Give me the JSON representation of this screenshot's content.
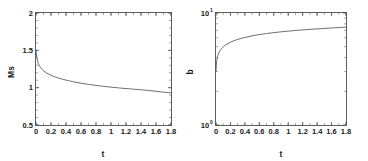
{
  "figure": {
    "panel_count": 2,
    "background_color": "#ffffff",
    "line_color": "#555555",
    "axis_color": "#4d4d4d"
  },
  "chart_data": [
    {
      "type": "line",
      "panel": "left",
      "title": "",
      "xlabel": "t",
      "ylabel": "Ms",
      "xlim": [
        0,
        1.8
      ],
      "ylim": [
        0.5,
        2
      ],
      "yscale": "linear",
      "xscale": "linear",
      "grid": false,
      "legend": null,
      "xticks": [
        "0",
        "0.2",
        "0.4",
        "0.6",
        "0.8",
        "1",
        "1.2",
        "1.4",
        "1.6",
        "1.8"
      ],
      "xtick_values": [
        0,
        0.2,
        0.4,
        0.6,
        0.8,
        1,
        1.2,
        1.4,
        1.6,
        1.8
      ],
      "yticks": [
        "0.5",
        "1",
        "1.5",
        "2"
      ],
      "ytick_values": [
        0.5,
        1,
        1.5,
        2
      ],
      "series": [
        {
          "name": "Ms(t)",
          "x": [
            0,
            0.01,
            0.02,
            0.03,
            0.05,
            0.07,
            0.1,
            0.13,
            0.16,
            0.2,
            0.25,
            0.3,
            0.35,
            0.4,
            0.45,
            0.5,
            0.6,
            0.7,
            0.8,
            0.9,
            1.0,
            1.1,
            1.2,
            1.3,
            1.4,
            1.5,
            1.6,
            1.7,
            1.8
          ],
          "y": [
            1.5,
            1.41,
            1.36,
            1.325,
            1.283,
            1.255,
            1.225,
            1.203,
            1.186,
            1.167,
            1.146,
            1.129,
            1.114,
            1.101,
            1.09,
            1.079,
            1.06,
            1.044,
            1.03,
            1.018,
            1.007,
            0.997,
            0.988,
            0.98,
            0.972,
            0.963,
            0.952,
            0.94,
            0.93
          ]
        }
      ]
    },
    {
      "type": "line",
      "panel": "right",
      "title": "",
      "xlabel": "t",
      "ylabel": "b",
      "xlim": [
        0,
        1.8
      ],
      "ylim": [
        1,
        10
      ],
      "yscale": "log",
      "xscale": "linear",
      "grid": false,
      "legend": null,
      "xticks": [
        "0",
        "0.2",
        "0.4",
        "0.6",
        "0.8",
        "1",
        "1.2",
        "1.4",
        "1.6",
        "1.8"
      ],
      "xtick_values": [
        0,
        0.2,
        0.4,
        0.6,
        0.8,
        1,
        1.2,
        1.4,
        1.6,
        1.8
      ],
      "yticks": [
        "10^0",
        "10^1"
      ],
      "ytick_base": "10",
      "ytick_exponents": [
        "0",
        "1"
      ],
      "ytick_values": [
        1,
        10
      ],
      "series": [
        {
          "name": "b(t)",
          "x": [
            0,
            0.005,
            0.01,
            0.02,
            0.03,
            0.05,
            0.07,
            0.1,
            0.13,
            0.16,
            0.2,
            0.25,
            0.3,
            0.35,
            0.4,
            0.5,
            0.6,
            0.7,
            0.8,
            0.9,
            1.0,
            1.1,
            1.2,
            1.3,
            1.4,
            1.5,
            1.6,
            1.7,
            1.8
          ],
          "y": [
            3.0,
            3.5,
            3.75,
            4.05,
            4.25,
            4.55,
            4.75,
            4.98,
            5.16,
            5.31,
            5.48,
            5.66,
            5.81,
            5.94,
            6.05,
            6.25,
            6.42,
            6.56,
            6.68,
            6.79,
            6.89,
            6.98,
            7.06,
            7.14,
            7.21,
            7.28,
            7.35,
            7.41,
            7.47
          ]
        }
      ]
    }
  ]
}
